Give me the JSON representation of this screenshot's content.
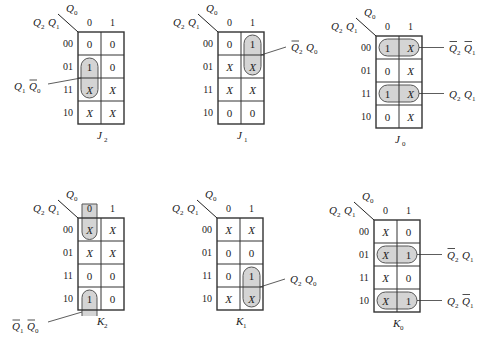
{
  "figure": {
    "row_var_label": "Q2Q1",
    "col_var_label": "Q0",
    "col_headers": [
      "0",
      "1"
    ],
    "row_headers": [
      "00",
      "01",
      "11",
      "10"
    ],
    "group_fill": "#d4d4d4",
    "line_color": "#333333"
  },
  "maps": [
    {
      "name": "J2",
      "label_main": "J",
      "label_sub": "2",
      "cells": [
        [
          "0",
          "0"
        ],
        [
          "1",
          "0"
        ],
        [
          "X",
          "X"
        ],
        [
          "X",
          "X"
        ]
      ],
      "groups": [
        {
          "term": "Q1·Q0'",
          "rows": [
            1,
            2
          ],
          "cols": [
            0
          ],
          "shape": "pill",
          "term_parts": [
            {
              "v": "Q",
              "s": "1",
              "bar": false
            },
            {
              "v": "Q",
              "s": "0",
              "bar": true
            }
          ],
          "label_side": "left"
        }
      ]
    },
    {
      "name": "J1",
      "label_main": "J",
      "label_sub": "1",
      "cells": [
        [
          "0",
          "1"
        ],
        [
          "X",
          "X"
        ],
        [
          "X",
          "X"
        ],
        [
          "0",
          "0"
        ]
      ],
      "groups": [
        {
          "term": "Q2'·Q0",
          "rows": [
            0,
            1
          ],
          "cols": [
            1
          ],
          "shape": "pill",
          "term_parts": [
            {
              "v": "Q",
              "s": "2",
              "bar": true
            },
            {
              "v": "Q",
              "s": "0",
              "bar": false
            }
          ],
          "label_side": "right"
        }
      ]
    },
    {
      "name": "J0",
      "label_main": "J",
      "label_sub": "0",
      "cells": [
        [
          "1",
          "X"
        ],
        [
          "0",
          "X"
        ],
        [
          "1",
          "X"
        ],
        [
          "0",
          "X"
        ]
      ],
      "groups": [
        {
          "term": "Q2'·Q1'",
          "rows": [
            0
          ],
          "cols": [
            0,
            1
          ],
          "shape": "pill",
          "term_parts": [
            {
              "v": "Q",
              "s": "2",
              "bar": true
            },
            {
              "v": "Q",
              "s": "1",
              "bar": true
            }
          ],
          "label_side": "right"
        },
        {
          "term": "Q2·Q1",
          "rows": [
            2
          ],
          "cols": [
            0,
            1
          ],
          "shape": "pill",
          "term_parts": [
            {
              "v": "Q",
              "s": "2",
              "bar": false
            },
            {
              "v": "Q",
              "s": "1",
              "bar": false
            }
          ],
          "label_side": "right"
        }
      ]
    },
    {
      "name": "K2",
      "label_main": "K",
      "label_sub": "2",
      "cells": [
        [
          "X",
          "X"
        ],
        [
          "X",
          "X"
        ],
        [
          "0",
          "0"
        ],
        [
          "1",
          "0"
        ]
      ],
      "groups": [
        {
          "term": "Q1'·Q0'",
          "rows": [
            0,
            3
          ],
          "cols": [
            0
          ],
          "shape": "wrap",
          "term_parts": [
            {
              "v": "Q",
              "s": "1",
              "bar": true
            },
            {
              "v": "Q",
              "s": "0",
              "bar": true
            }
          ],
          "label_side": "bottom-left"
        }
      ]
    },
    {
      "name": "K1",
      "label_main": "K",
      "label_sub": "1",
      "cells": [
        [
          "X",
          "X"
        ],
        [
          "0",
          "0"
        ],
        [
          "0",
          "1"
        ],
        [
          "X",
          "X"
        ]
      ],
      "groups": [
        {
          "term": "Q2·Q0",
          "rows": [
            2,
            3
          ],
          "cols": [
            1
          ],
          "shape": "pill",
          "term_parts": [
            {
              "v": "Q",
              "s": "2",
              "bar": false
            },
            {
              "v": "Q",
              "s": "0",
              "bar": false
            }
          ],
          "label_side": "right"
        }
      ]
    },
    {
      "name": "K0",
      "label_main": "K",
      "label_sub": "0",
      "cells": [
        [
          "X",
          "0"
        ],
        [
          "X",
          "1"
        ],
        [
          "X",
          "0"
        ],
        [
          "X",
          "1"
        ]
      ],
      "groups": [
        {
          "term": "Q2'·Q1",
          "rows": [
            1
          ],
          "cols": [
            0,
            1
          ],
          "shape": "pill",
          "term_parts": [
            {
              "v": "Q",
              "s": "2",
              "bar": true
            },
            {
              "v": "Q",
              "s": "1",
              "bar": false
            }
          ],
          "label_side": "right"
        },
        {
          "term": "Q2·Q1'",
          "rows": [
            3
          ],
          "cols": [
            0,
            1
          ],
          "shape": "pill",
          "term_parts": [
            {
              "v": "Q",
              "s": "2",
              "bar": false
            },
            {
              "v": "Q",
              "s": "1",
              "bar": true
            }
          ],
          "label_side": "right"
        }
      ]
    }
  ]
}
